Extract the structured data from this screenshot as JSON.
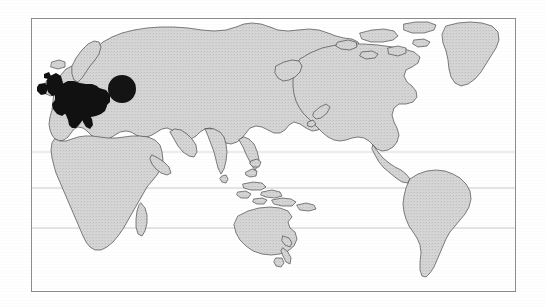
{
  "figure": {
    "kind": "world-map",
    "title": "",
    "caption": "",
    "projection": "equirectangular-cropped",
    "background_color": "#ffffff"
  },
  "frame": {
    "name": "map-border",
    "x": 31,
    "y": 18,
    "width": 485,
    "height": 274,
    "stroke_color": "#8c8c8c",
    "stroke_width": 1,
    "fill_color": "#ffffff"
  },
  "style": {
    "land_fill": "#d2d2d2",
    "land_stroke": "#4a4a4a",
    "border_stroke": "#5a5a5a",
    "highlight_fill": "#111111",
    "marker_fill": "#141414",
    "gridline_color": "#b9b9b9",
    "ocean_fill": "#ffffff"
  },
  "gridlines": {
    "name": "latitude-gridlines",
    "orientation": "horizontal",
    "y_positions": [
      152,
      188,
      228
    ],
    "labels": [
      "",
      "",
      ""
    ]
  },
  "highlight_region": {
    "name": "europe-highlight",
    "label": "",
    "color": "#111111",
    "description": "Western and Central Europe filled solid black"
  },
  "marker": {
    "name": "circle-marker",
    "label": "",
    "shape": "circle",
    "center_x": 122,
    "center_y": 89,
    "radius": 14,
    "color": "#141414"
  },
  "landmasses": [
    {
      "name": "eurasia",
      "label": ""
    },
    {
      "name": "africa",
      "label": ""
    },
    {
      "name": "north-america",
      "label": ""
    },
    {
      "name": "south-america",
      "label": ""
    },
    {
      "name": "australia",
      "label": ""
    },
    {
      "name": "greenland",
      "label": ""
    },
    {
      "name": "new-zealand",
      "label": ""
    },
    {
      "name": "madagascar",
      "label": ""
    },
    {
      "name": "indonesia",
      "label": ""
    },
    {
      "name": "japan",
      "label": ""
    },
    {
      "name": "british-isles",
      "label": ""
    },
    {
      "name": "iceland",
      "label": ""
    }
  ]
}
